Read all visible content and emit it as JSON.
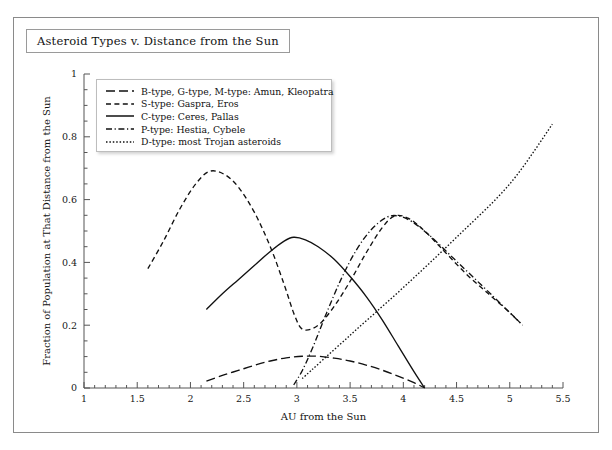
{
  "figure": {
    "title": "Asteroid Types v. Distance from the Sun"
  },
  "legend": {
    "items": [
      {
        "label": "B-type, G-type, M-type: Amun, Kleopatra",
        "dash": "long-dash",
        "key": "b-type"
      },
      {
        "label": "S-type: Gaspra, Eros",
        "dash": "short-dash",
        "key": "s-type"
      },
      {
        "label": "C-type: Ceres, Pallas",
        "dash": "solid",
        "key": "c-type"
      },
      {
        "label": "P-type: Hestia, Cybele",
        "dash": "dash-dot",
        "key": "p-type"
      },
      {
        "label": "D-type: most Trojan asteroids",
        "dash": "dotted",
        "key": "d-type"
      }
    ]
  },
  "chart_data": {
    "type": "line",
    "title": "Asteroid Types v. Distance from the Sun",
    "xlabel": "AU from the Sun",
    "ylabel": "Fraction of Population at That Distance from the Sun",
    "xlim": [
      1,
      5.5
    ],
    "ylim": [
      0,
      1
    ],
    "xticks": [
      1,
      1.5,
      2,
      2.5,
      3,
      3.5,
      4,
      4.5,
      5,
      5.5
    ],
    "xtick_labels": [
      "1",
      "1.5",
      "2",
      "2.5",
      "3",
      "3.5",
      "4",
      "4.5",
      "5",
      "5.5"
    ],
    "xminor_step": 0.1,
    "yticks": [
      0,
      0.2,
      0.4,
      0.6,
      0.8,
      1
    ],
    "ytick_labels": [
      "0",
      "0.2",
      "0.4",
      "0.6",
      "0.8",
      "1"
    ],
    "yminor_step": 0.05,
    "grid": false,
    "legend_position": "upper-left-inside",
    "series": [
      {
        "name": "B-type, G-type, M-type: Amun, Kleopatra",
        "short_name": "B-type",
        "style": "long-dash",
        "points": [
          [
            2.15,
            0.022
          ],
          [
            2.3,
            0.04
          ],
          [
            2.45,
            0.056
          ],
          [
            2.6,
            0.072
          ],
          [
            2.75,
            0.086
          ],
          [
            2.9,
            0.096
          ],
          [
            3.05,
            0.101
          ],
          [
            3.2,
            0.101
          ],
          [
            3.35,
            0.095
          ],
          [
            3.5,
            0.086
          ],
          [
            3.65,
            0.073
          ],
          [
            3.8,
            0.057
          ],
          [
            3.95,
            0.038
          ],
          [
            4.1,
            0.017
          ],
          [
            4.2,
            0.0
          ]
        ]
      },
      {
        "name": "S-type: Gaspra, Eros",
        "short_name": "S-type",
        "style": "short-dash",
        "points": [
          [
            1.6,
            0.38
          ],
          [
            1.75,
            0.47
          ],
          [
            1.9,
            0.57
          ],
          [
            2.05,
            0.65
          ],
          [
            2.18,
            0.69
          ],
          [
            2.32,
            0.68
          ],
          [
            2.45,
            0.64
          ],
          [
            2.6,
            0.56
          ],
          [
            2.75,
            0.45
          ],
          [
            2.88,
            0.33
          ],
          [
            2.98,
            0.23
          ],
          [
            3.06,
            0.186
          ],
          [
            3.2,
            0.2
          ],
          [
            3.35,
            0.26
          ],
          [
            3.5,
            0.34
          ],
          [
            3.65,
            0.43
          ],
          [
            3.8,
            0.51
          ],
          [
            3.92,
            0.548
          ],
          [
            4.05,
            0.54
          ],
          [
            4.2,
            0.5
          ],
          [
            4.4,
            0.43
          ],
          [
            4.6,
            0.36
          ],
          [
            4.8,
            0.3
          ],
          [
            5.0,
            0.24
          ],
          [
            5.12,
            0.2
          ]
        ]
      },
      {
        "name": "C-type: Ceres, Pallas",
        "short_name": "C-type",
        "style": "solid",
        "points": [
          [
            2.15,
            0.25
          ],
          [
            2.3,
            0.3
          ],
          [
            2.45,
            0.345
          ],
          [
            2.6,
            0.39
          ],
          [
            2.75,
            0.435
          ],
          [
            2.88,
            0.468
          ],
          [
            2.97,
            0.48
          ],
          [
            3.08,
            0.472
          ],
          [
            3.2,
            0.45
          ],
          [
            3.35,
            0.41
          ],
          [
            3.5,
            0.355
          ],
          [
            3.65,
            0.292
          ],
          [
            3.8,
            0.218
          ],
          [
            3.95,
            0.135
          ],
          [
            4.1,
            0.052
          ],
          [
            4.2,
            0.0
          ]
        ]
      },
      {
        "name": "P-type: Hestia, Cybele",
        "short_name": "P-type",
        "style": "dash-dot",
        "points": [
          [
            2.97,
            0.01
          ],
          [
            3.05,
            0.055
          ],
          [
            3.15,
            0.13
          ],
          [
            3.28,
            0.24
          ],
          [
            3.42,
            0.35
          ],
          [
            3.56,
            0.44
          ],
          [
            3.7,
            0.505
          ],
          [
            3.84,
            0.543
          ],
          [
            3.95,
            0.548
          ],
          [
            4.08,
            0.53
          ],
          [
            4.25,
            0.485
          ],
          [
            4.45,
            0.42
          ],
          [
            4.65,
            0.355
          ],
          [
            4.85,
            0.29
          ],
          [
            5.0,
            0.24
          ],
          [
            5.12,
            0.2
          ]
        ]
      },
      {
        "name": "D-type: most Trojan asteroids",
        "short_name": "D-type",
        "style": "dotted",
        "points": [
          [
            3.05,
            0.03
          ],
          [
            3.5,
            0.168
          ],
          [
            4.0,
            0.32
          ],
          [
            4.5,
            0.48
          ],
          [
            5.0,
            0.65
          ],
          [
            5.4,
            0.84
          ]
        ]
      }
    ]
  }
}
